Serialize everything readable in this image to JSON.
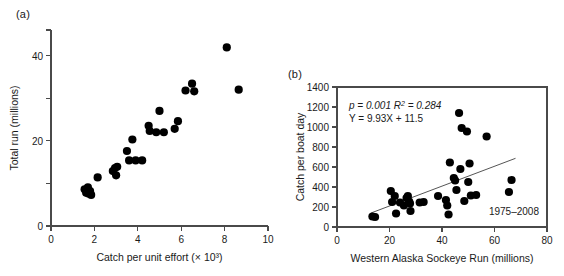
{
  "figure": {
    "panel_a_label": "(a)",
    "panel_b_label": "(b)"
  },
  "chart_data": [
    {
      "id": "panel-a",
      "type": "scatter",
      "title": "",
      "xlabel": "Catch per unit effort (× 10³)",
      "ylabel": "Total run (millions)",
      "xlim": [
        0,
        10
      ],
      "ylim": [
        0,
        46
      ],
      "xticks": [
        0,
        2,
        4,
        6,
        8,
        10
      ],
      "xticklabels": [
        "0",
        "2",
        "4",
        "6",
        "8",
        "10"
      ],
      "yticks": [
        0,
        10,
        20,
        30,
        40,
        46
      ],
      "yticklabels": [
        "0",
        "",
        "20",
        "",
        "40",
        ""
      ],
      "grid": false,
      "legend": "none",
      "marker": "filled-circle",
      "points": [
        {
          "x": 1.55,
          "y": 8.6
        },
        {
          "x": 1.62,
          "y": 7.8
        },
        {
          "x": 1.7,
          "y": 9.1
        },
        {
          "x": 1.72,
          "y": 7.6
        },
        {
          "x": 1.8,
          "y": 8.2
        },
        {
          "x": 1.85,
          "y": 7.3
        },
        {
          "x": 2.15,
          "y": 11.4
        },
        {
          "x": 2.85,
          "y": 12.9
        },
        {
          "x": 2.95,
          "y": 13.6
        },
        {
          "x": 3.0,
          "y": 11.9
        },
        {
          "x": 3.05,
          "y": 13.9
        },
        {
          "x": 3.5,
          "y": 17.6
        },
        {
          "x": 3.6,
          "y": 15.4
        },
        {
          "x": 3.75,
          "y": 20.3
        },
        {
          "x": 3.9,
          "y": 15.4
        },
        {
          "x": 4.2,
          "y": 15.4
        },
        {
          "x": 4.5,
          "y": 23.5
        },
        {
          "x": 4.55,
          "y": 22.3
        },
        {
          "x": 4.85,
          "y": 22.0
        },
        {
          "x": 5.0,
          "y": 27.0
        },
        {
          "x": 5.2,
          "y": 22.0
        },
        {
          "x": 5.7,
          "y": 22.8
        },
        {
          "x": 5.85,
          "y": 24.6
        },
        {
          "x": 6.2,
          "y": 31.8
        },
        {
          "x": 6.5,
          "y": 33.4
        },
        {
          "x": 6.6,
          "y": 31.6
        },
        {
          "x": 8.1,
          "y": 41.9
        },
        {
          "x": 8.65,
          "y": 32.0
        }
      ]
    },
    {
      "id": "panel-b",
      "type": "scatter",
      "title": "",
      "xlabel": "Western Alaska Sockeye Run (millions)",
      "ylabel": "Catch per boat day",
      "xlim": [
        0,
        80
      ],
      "ylim": [
        0,
        1400
      ],
      "xticks": [
        0,
        20,
        40,
        60,
        80
      ],
      "xticklabels": [
        "0",
        "20",
        "40",
        "60",
        "80"
      ],
      "yticks": [
        0,
        200,
        400,
        600,
        800,
        1000,
        1200,
        1400
      ],
      "yticklabels": [
        "0",
        "200",
        "400",
        "600",
        "800",
        "1000",
        "1200",
        "1400"
      ],
      "grid": false,
      "legend": "none",
      "marker": "filled-circle",
      "annotations": {
        "stats_line1": "p = 0.001 R² = 0.284",
        "stats_line1_parts": {
          "p_label": "p",
          "p_value": "0.001",
          "r2_label": "R²",
          "r2_value": "0.284"
        },
        "stats_line2": "Y = 9.93X + 11.5",
        "period": "1975–2008"
      },
      "fit": {
        "slope": 9.93,
        "intercept": 11.5,
        "x_start": 13,
        "x_end": 68,
        "p_value": 0.001,
        "r_squared": 0.284
      },
      "points": [
        {
          "x": 13.5,
          "y": 105
        },
        {
          "x": 14.5,
          "y": 100
        },
        {
          "x": 20.5,
          "y": 360
        },
        {
          "x": 21.0,
          "y": 250
        },
        {
          "x": 22.0,
          "y": 310
        },
        {
          "x": 22.5,
          "y": 135
        },
        {
          "x": 24.0,
          "y": 245
        },
        {
          "x": 25.5,
          "y": 215
        },
        {
          "x": 26.5,
          "y": 290
        },
        {
          "x": 27.0,
          "y": 310
        },
        {
          "x": 27.5,
          "y": 255
        },
        {
          "x": 27.8,
          "y": 235
        },
        {
          "x": 28.0,
          "y": 160
        },
        {
          "x": 31.5,
          "y": 245
        },
        {
          "x": 33.0,
          "y": 250
        },
        {
          "x": 38.5,
          "y": 310
        },
        {
          "x": 41.5,
          "y": 270
        },
        {
          "x": 42.0,
          "y": 215
        },
        {
          "x": 42.5,
          "y": 125
        },
        {
          "x": 43.0,
          "y": 645
        },
        {
          "x": 44.5,
          "y": 490
        },
        {
          "x": 45.0,
          "y": 465
        },
        {
          "x": 45.5,
          "y": 370
        },
        {
          "x": 46.5,
          "y": 1140
        },
        {
          "x": 47.0,
          "y": 580
        },
        {
          "x": 47.5,
          "y": 990
        },
        {
          "x": 48.5,
          "y": 260
        },
        {
          "x": 49.5,
          "y": 955
        },
        {
          "x": 50.0,
          "y": 450
        },
        {
          "x": 50.5,
          "y": 635
        },
        {
          "x": 51.0,
          "y": 315
        },
        {
          "x": 53.0,
          "y": 320
        },
        {
          "x": 57.0,
          "y": 905
        },
        {
          "x": 65.5,
          "y": 350
        },
        {
          "x": 66.5,
          "y": 470
        }
      ]
    }
  ]
}
